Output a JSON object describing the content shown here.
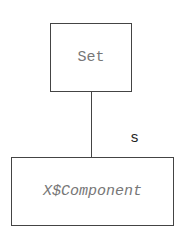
{
  "diagram": {
    "nodes": [
      {
        "id": "set",
        "label": "Set"
      },
      {
        "id": "component",
        "label": "X$Component"
      }
    ],
    "edges": [
      {
        "from": "set",
        "to": "component",
        "label": "s"
      }
    ]
  }
}
